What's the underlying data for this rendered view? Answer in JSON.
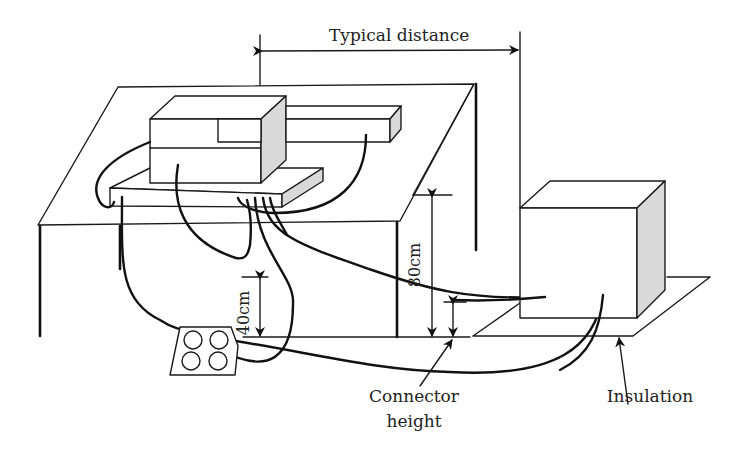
{
  "figure": {
    "colors": {
      "line": "#1a1a1a",
      "shaded_face": "#d9d9d9",
      "background": "#ffffff"
    }
  },
  "labels": {
    "typical_distance": "Typical distance",
    "height_80": "80cm",
    "height_40": "40cm",
    "connector_height_line1": "Connector",
    "connector_height_line2": "height",
    "insulation": "Insulation"
  },
  "components": [
    {
      "name": "table",
      "description": "Non-conductive table, 80cm high"
    },
    {
      "name": "equipment-under-test",
      "description": "Main unit on raised platform with side bar"
    },
    {
      "name": "ground-connector-panel",
      "description": "Panel with four round connectors, 40cm below table edge"
    },
    {
      "name": "auxiliary-box",
      "description": "Floor-standing unit on insulation sheet"
    },
    {
      "name": "insulation-sheet",
      "description": "Insulating mat under floor unit"
    }
  ],
  "connector_panel": {
    "connector_count": 4
  }
}
